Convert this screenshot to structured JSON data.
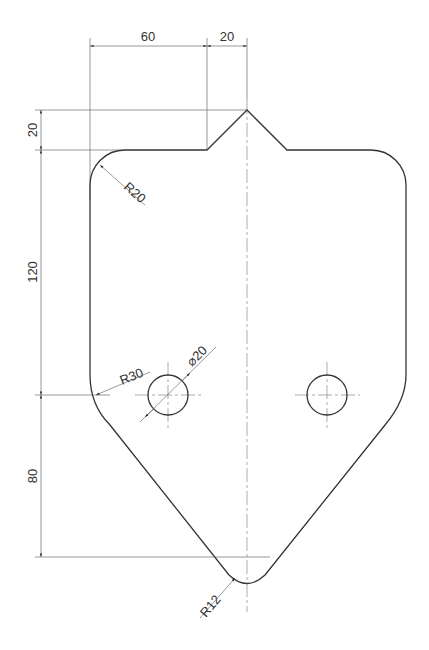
{
  "drawing": {
    "title": "Technical drawing - plate with notch and two holes",
    "dimensions": {
      "top_left_width": "60",
      "top_notch_width": "20",
      "notch_height": "20",
      "side_height": "120",
      "bottom_height": "80",
      "corner_radius_top": "R20",
      "corner_radius_side": "R30",
      "hole_diameter": "⌀20",
      "bottom_radius": "R12"
    },
    "colors": {
      "outline": "#333333",
      "dimension": "#555555",
      "background": "#ffffff"
    }
  }
}
